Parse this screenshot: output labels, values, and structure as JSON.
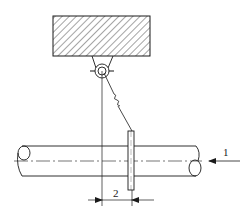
{
  "diagram": {
    "type": "engineering-schematic",
    "components": {
      "support_block": {
        "fill": "hatched",
        "x": 53,
        "y": 16,
        "w": 97,
        "h": 40
      },
      "pulley": {
        "cx": 102,
        "cy": 71,
        "r_outer": 7,
        "r_inner": 4
      },
      "plumb_line": {
        "x": 102,
        "y1": 71,
        "y2": 206
      },
      "wire": {
        "from": [
          104,
          73
        ],
        "to": [
          132,
          131
        ],
        "break_mark": true
      },
      "plate": {
        "x": 128,
        "y": 131,
        "w": 6,
        "h": 59
      },
      "pipe": {
        "x1": 18,
        "x2": 198,
        "top": 146,
        "bottom": 176,
        "centerline_y": 161
      }
    },
    "labels": {
      "flow_arrow_label": "1",
      "dimension_label": "2"
    },
    "colors": {
      "line": "#1a1a1a",
      "background": "#ffffff"
    }
  }
}
